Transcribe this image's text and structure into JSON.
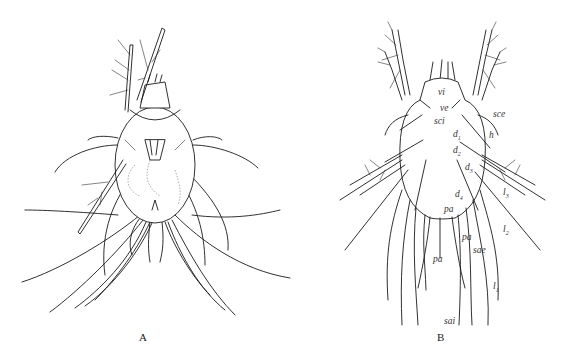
{
  "figure": {
    "panels": [
      {
        "id": "A",
        "label": "A",
        "description": "Ventral view of mite with legs and long setae"
      },
      {
        "id": "B",
        "label": "B",
        "description": "Dorsal view of mite with labeled setae"
      }
    ],
    "panel_b_labels": {
      "vi": "vi",
      "ve": "ve",
      "sci": "sci",
      "sce": "sce",
      "d1": "d",
      "d1_sub": "1",
      "h": "h",
      "d2": "d",
      "d2_sub": "2",
      "d3": "d",
      "d3_sub": "3",
      "l3": "l",
      "l3_sub": "3",
      "d4": "d",
      "d4_sub": "4",
      "pa_upper": "pa",
      "pa_middle": "pa",
      "l2": "l",
      "l2_sub": "2",
      "sae": "sae",
      "pa_lower": "pa",
      "l1": "l",
      "l1_sub": "1",
      "sai": "sai"
    }
  }
}
